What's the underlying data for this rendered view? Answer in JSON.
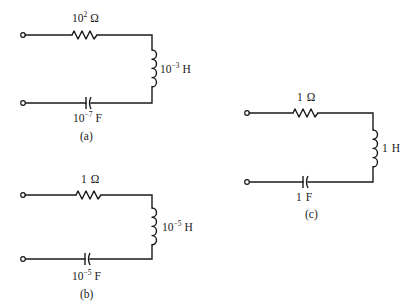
{
  "diagram": {
    "type": "series RLC circuits",
    "circuits": [
      {
        "id": "a",
        "caption": "(a)",
        "resistor": {
          "base": "10",
          "exp": "2",
          "unit": "Ω"
        },
        "inductor": {
          "base": "10",
          "exp": "−3",
          "unit": "H"
        },
        "capacitor": {
          "base": "10",
          "exp": "−7",
          "unit": "F"
        }
      },
      {
        "id": "b",
        "caption": "(b)",
        "resistor": {
          "base": "1",
          "exp": "",
          "unit": "Ω"
        },
        "inductor": {
          "base": "10",
          "exp": "−5",
          "unit": "H"
        },
        "capacitor": {
          "base": "10",
          "exp": "−5",
          "unit": "F"
        }
      },
      {
        "id": "c",
        "caption": "(c)",
        "resistor": {
          "base": "1",
          "exp": "",
          "unit": "Ω"
        },
        "inductor": {
          "base": "1",
          "exp": "",
          "unit": "H"
        },
        "capacitor": {
          "base": "1",
          "exp": "",
          "unit": "F"
        }
      }
    ],
    "colors": {
      "line": "#1a1a1a",
      "background": "#ffffff"
    }
  }
}
